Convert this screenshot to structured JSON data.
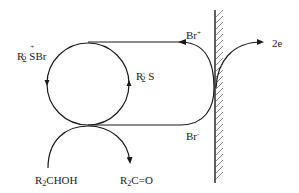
{
  "diagram": {
    "colors": {
      "line": "#1a1a1a",
      "hatch": "#555555",
      "background": "#ffffff"
    },
    "labels": {
      "sulfonium_bromide": {
        "base": "R",
        "prime_sub": "2",
        "prime": "'",
        "dot": "+",
        "rest": "SBr"
      },
      "sulfide": {
        "base": "R",
        "prime": "'",
        "sub": "2",
        "rest": " S"
      },
      "br_plus": {
        "base": "Br",
        "sup": "+"
      },
      "br_minus": {
        "base": "Br",
        "sup": "-"
      },
      "electrons": "2e",
      "alcohol": {
        "base": "R",
        "sub": "2",
        "rest": "CHOH"
      },
      "ketone": {
        "base": "R",
        "sub": "2",
        "rest": "C=O"
      }
    },
    "elements": {
      "mediator_cycle": "circle",
      "electrode": "hatched vertical electrode surface",
      "electron_arrow": "2e leaving electrode",
      "substrate_arc": "R2CHOH to R2C=O"
    }
  }
}
